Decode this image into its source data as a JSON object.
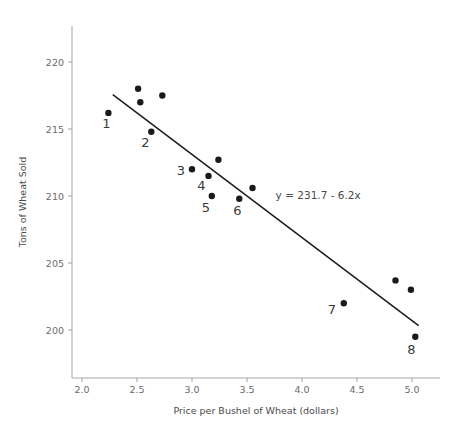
{
  "chart_data": {
    "type": "scatter",
    "title": "",
    "xlabel": "Price per Bushel of Wheat (dollars)",
    "ylabel": "Tons of Wheat Sold",
    "xlim": [
      1.88,
      5.22
    ],
    "ylim": [
      197.2,
      221.6
    ],
    "grid": false,
    "legend": null,
    "xticks": [
      "2.0",
      "2.5",
      "3.0",
      "3.5",
      "4.0",
      "4.5",
      "5.0"
    ],
    "xtick_values": [
      2.0,
      2.5,
      3.0,
      3.5,
      4.0,
      4.5,
      5.0
    ],
    "yticks": [
      "200",
      "205",
      "210",
      "215",
      "220"
    ],
    "ytick_values": [
      200,
      205,
      210,
      215,
      220
    ],
    "x": [
      2.24,
      2.51,
      2.53,
      2.73,
      2.63,
      3.0,
      3.24,
      3.15,
      3.18,
      3.43,
      3.55,
      4.38,
      4.85,
      4.99,
      5.03
    ],
    "y": [
      216.2,
      218.0,
      217.0,
      217.5,
      214.8,
      212.0,
      212.7,
      211.5,
      210.0,
      209.8,
      210.6,
      202.0,
      203.7,
      203.0,
      199.5
    ],
    "point_labels": [
      "1",
      "",
      "",
      "",
      "2",
      "3",
      "",
      "4",
      "5",
      "6",
      "",
      "7",
      "",
      "",
      "8"
    ],
    "points": [
      {
        "x": 2.24,
        "y": 216.2,
        "label": "1",
        "label_dx": -2,
        "label_dy": 15
      },
      {
        "x": 2.51,
        "y": 218.0,
        "label": "",
        "label_dx": 0,
        "label_dy": 0
      },
      {
        "x": 2.53,
        "y": 217.0,
        "label": "",
        "label_dx": 0,
        "label_dy": 0
      },
      {
        "x": 2.73,
        "y": 217.5,
        "label": "",
        "label_dx": 0,
        "label_dy": 0
      },
      {
        "x": 2.63,
        "y": 214.8,
        "label": "2",
        "label_dx": -6,
        "label_dy": 15
      },
      {
        "x": 3.0,
        "y": 212.0,
        "label": "3",
        "label_dx": -11,
        "label_dy": 6
      },
      {
        "x": 3.24,
        "y": 212.7,
        "label": "",
        "label_dx": 0,
        "label_dy": 0
      },
      {
        "x": 3.15,
        "y": 211.5,
        "label": "4",
        "label_dx": -7,
        "label_dy": 14
      },
      {
        "x": 3.18,
        "y": 210.0,
        "label": "5",
        "label_dx": -6,
        "label_dy": 16
      },
      {
        "x": 3.43,
        "y": 209.8,
        "label": "6",
        "label_dx": -2,
        "label_dy": 16
      },
      {
        "x": 3.55,
        "y": 210.6,
        "label": "",
        "label_dx": 0,
        "label_dy": 0
      },
      {
        "x": 4.38,
        "y": 202.0,
        "label": "7",
        "label_dx": -12,
        "label_dy": 11
      },
      {
        "x": 4.85,
        "y": 203.7,
        "label": "",
        "label_dx": 0,
        "label_dy": 0
      },
      {
        "x": 4.99,
        "y": 203.0,
        "label": "",
        "label_dx": 0,
        "label_dy": 0
      },
      {
        "x": 5.03,
        "y": 199.5,
        "label": "8",
        "label_dx": -4,
        "label_dy": 17
      }
    ],
    "fit_line": {
      "equation_text": "y = 231.7 - 6.2x",
      "intercept": 231.7,
      "slope": -6.2,
      "x_start": 2.28,
      "x_end": 5.06,
      "annotation_x": 3.76,
      "annotation_y": 209.8
    },
    "marker": {
      "shape": "circle",
      "radius": 3.2,
      "color": "#1a1a1a"
    },
    "colors": {
      "point": "#1a1a1a",
      "line": "#1a1a1a",
      "axis": "#a9a9a9",
      "tick_text": "#6b6b6b",
      "axis_title": "#4a4a4a",
      "background": "#ffffff"
    }
  }
}
